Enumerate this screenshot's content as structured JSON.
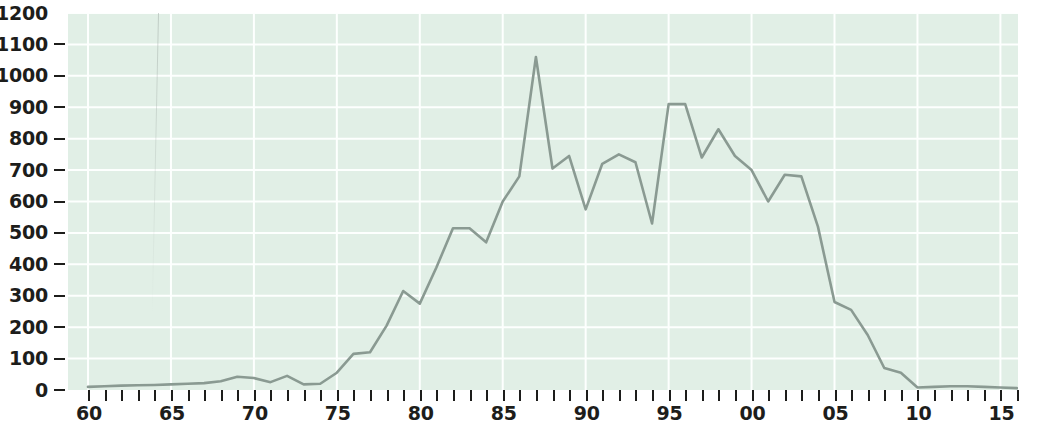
{
  "chart_data": {
    "type": "line",
    "title": "",
    "subtitle": "",
    "xlabel": "",
    "ylabel": "",
    "xlim": [
      1960,
      2016
    ],
    "ylim": [
      0,
      1200
    ],
    "grid": true,
    "legend": null,
    "colors": {
      "plot_background": "#e1efe6",
      "gridline": "#fdfffe",
      "line": "#8a9a92",
      "axis_text": "#1d1d1b",
      "page_background": "#ffffff"
    },
    "y_ticks": [
      0,
      100,
      200,
      300,
      400,
      500,
      600,
      700,
      800,
      900,
      1000,
      1100,
      1200
    ],
    "y_tick_labels": [
      "0",
      "100",
      "200",
      "300",
      "400",
      "500",
      "600",
      "700",
      "800",
      "900",
      "1000",
      "1100",
      "1200"
    ],
    "x_ticks": [
      1960,
      1961,
      1962,
      1963,
      1964,
      1965,
      1966,
      1967,
      1968,
      1969,
      1970,
      1971,
      1972,
      1973,
      1974,
      1975,
      1976,
      1977,
      1978,
      1979,
      1980,
      1981,
      1982,
      1983,
      1984,
      1985,
      1986,
      1987,
      1988,
      1989,
      1990,
      1991,
      1992,
      1993,
      1994,
      1995,
      1996,
      1997,
      1998,
      1999,
      2000,
      2001,
      2002,
      2003,
      2004,
      2005,
      2006,
      2007,
      2008,
      2009,
      2010,
      2011,
      2012,
      2013,
      2014,
      2015,
      2016
    ],
    "x_labeled_ticks": [
      {
        "value": 1960,
        "label": "60"
      },
      {
        "value": 1965,
        "label": "65"
      },
      {
        "value": 1970,
        "label": "70"
      },
      {
        "value": 1975,
        "label": "75"
      },
      {
        "value": 1980,
        "label": "80"
      },
      {
        "value": 1985,
        "label": "85"
      },
      {
        "value": 1990,
        "label": "90"
      },
      {
        "value": 1995,
        "label": "95"
      },
      {
        "value": 2000,
        "label": "00"
      },
      {
        "value": 2005,
        "label": "05"
      },
      {
        "value": 2010,
        "label": "10"
      },
      {
        "value": 2015,
        "label": "15"
      }
    ],
    "x": [
      1960,
      1961,
      1962,
      1963,
      1964,
      1965,
      1966,
      1967,
      1968,
      1969,
      1970,
      1971,
      1972,
      1973,
      1974,
      1975,
      1976,
      1977,
      1978,
      1979,
      1980,
      1981,
      1982,
      1983,
      1984,
      1985,
      1986,
      1987,
      1988,
      1989,
      1990,
      1991,
      1992,
      1993,
      1994,
      1995,
      1996,
      1997,
      1998,
      1999,
      2000,
      2001,
      2002,
      2003,
      2004,
      2005,
      2006,
      2007,
      2008,
      2009,
      2010,
      2011,
      2012,
      2013,
      2014,
      2015,
      2016
    ],
    "values": [
      10,
      12,
      14,
      15,
      16,
      18,
      20,
      22,
      28,
      42,
      38,
      25,
      45,
      18,
      20,
      55,
      115,
      120,
      205,
      315,
      275,
      390,
      515,
      515,
      470,
      600,
      680,
      1060,
      705,
      745,
      575,
      720,
      750,
      725,
      530,
      910,
      910,
      740,
      830,
      745,
      700,
      600,
      685,
      680,
      520,
      280,
      255,
      175,
      70,
      55,
      8,
      10,
      12,
      12,
      10,
      8,
      6
    ],
    "series": [
      {
        "name": "series-1",
        "values": [
          10,
          12,
          14,
          15,
          16,
          18,
          20,
          22,
          28,
          42,
          38,
          25,
          45,
          18,
          20,
          55,
          115,
          120,
          205,
          315,
          275,
          390,
          515,
          515,
          470,
          600,
          680,
          1060,
          705,
          745,
          575,
          720,
          750,
          725,
          530,
          910,
          910,
          740,
          830,
          745,
          700,
          600,
          685,
          680,
          520,
          280,
          255,
          175,
          70,
          55,
          8,
          10,
          12,
          12,
          10,
          8,
          6
        ]
      }
    ],
    "annotations": []
  }
}
